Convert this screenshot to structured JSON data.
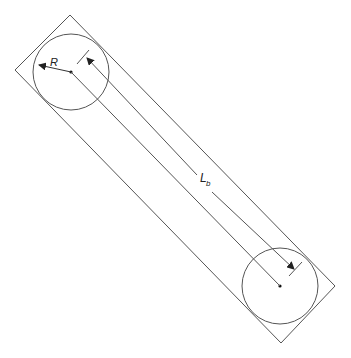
{
  "diagram": {
    "labels": {
      "radius": "R",
      "length_main": "L",
      "length_sub": "b"
    },
    "colors": {
      "stroke": "#555555",
      "text": "#222222",
      "background": "#ffffff"
    }
  }
}
